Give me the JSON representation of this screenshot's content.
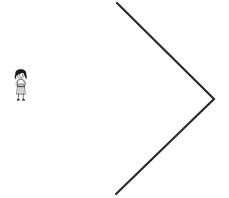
{
  "canvas": {
    "width": 229,
    "height": 198,
    "background_color": "#ffffff",
    "title": "Line drawing: child figure facing a large chevron"
  },
  "ink": {
    "line_color": "#2b2b2b",
    "figure_color": "#1a1a1a",
    "line_width": 2
  },
  "chevron": {
    "label": "chevron-right",
    "description": "Large open angle bracket pointing right",
    "points": [
      {
        "x": 117,
        "y": 3
      },
      {
        "x": 214,
        "y": 99
      },
      {
        "x": 116,
        "y": 194
      }
    ],
    "stroke_width": 2.2,
    "vertex_x": 214,
    "vertex_y": 99
  },
  "figure": {
    "label": "girl-figure",
    "x": 12,
    "y": 69,
    "width": 18,
    "height": 32,
    "hair_color": "#1a1a1a",
    "outline_color": "#1a1a1a",
    "skin_color": "#ffffff",
    "clothing_color": "#ffffff"
  }
}
